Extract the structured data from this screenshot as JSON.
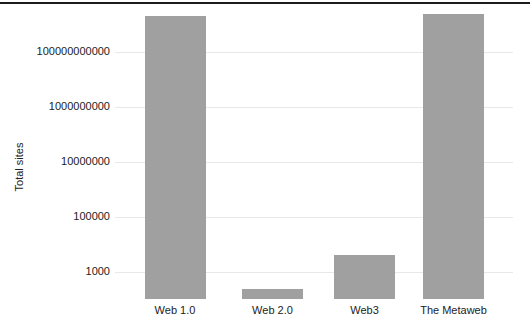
{
  "chart_data": {
    "type": "bar",
    "title": "",
    "ylabel": "Total sites",
    "xlabel": "",
    "categories": [
      "Web 1.0",
      "Web 2.0",
      "Web3",
      "The Metaweb"
    ],
    "values": [
      2000000000000,
      240,
      4000,
      2400000000000
    ],
    "yscale": "log",
    "ymin": 100,
    "yticks": [
      1000,
      100000,
      10000000,
      1000000000,
      100000000000
    ],
    "ytick_labels": [
      "1000",
      "100000",
      "10000000",
      "1000000000",
      "100000000000"
    ],
    "grid": true,
    "legend": "none",
    "colors": {
      "bar": "#a0a0a0",
      "gridline": "#e8e8e8",
      "text": "#222222",
      "top_rule": "#1c1c1c",
      "background": "#ffffff"
    }
  }
}
